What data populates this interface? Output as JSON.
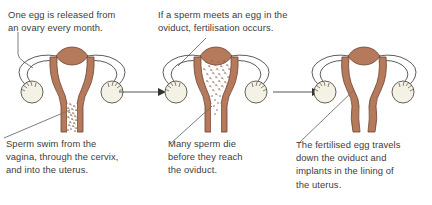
{
  "figure": {
    "background_color": "#ffffff",
    "text_color": "#3c3c3c",
    "organ_color": "#b5795c",
    "organ_outline_color": "#6d4230",
    "ovary_fill_color": "#f4f2e4",
    "ovary_outline_color": "#55504a",
    "outline_color": "#4a4a4a",
    "arrow_color": "#555555",
    "leader_color": "#6f6f6f",
    "sperm_color": "#8a6a55"
  },
  "panels": [
    {
      "id": "panel-1",
      "step_number": "1",
      "caption_top": "One egg is released from\nan ovary every month.",
      "caption_bottom": "Sperm swim from the\nvagina, through the cervix,\nand into the uterus.",
      "diagram_name": "uterus-diagram-egg-release",
      "leader_top_target": "left-ovary",
      "leader_bottom_target": "cervix-and-vagina",
      "sperm_count": 28,
      "sperm_region": "vagina-cervix"
    },
    {
      "id": "panel-2",
      "step_number": "2",
      "caption_top": "If a sperm meets an egg in the\noviduct, fertilisation occurs.",
      "caption_bottom": "Many sperm die\nbefore they reach\nthe oviduct.",
      "diagram_name": "uterus-diagram-sperm-ascent",
      "leader_top_target": "left-oviduct",
      "leader_bottom_target": "uterus-cavity",
      "sperm_count": 70,
      "sperm_region": "uterus-cavity"
    },
    {
      "id": "panel-3",
      "step_number": "3",
      "caption_top": "",
      "caption_bottom": "The fertilised egg travels\ndown the oviduct and\nimplants in the lining of\nthe uterus.",
      "diagram_name": "uterus-diagram-implantation",
      "leader_top_target": "",
      "leader_bottom_target": "uterus-lining",
      "sperm_count": 0,
      "sperm_region": ""
    }
  ],
  "arrows": [
    {
      "id": "arrow-1-to-2",
      "label": "sequence arrow one to two"
    },
    {
      "id": "arrow-2-to-3",
      "label": "sequence arrow two to three"
    }
  ],
  "anatomy_labels": {
    "ovary": "ovary",
    "oviduct": "oviduct",
    "uterus": "uterus",
    "cervix": "cervix",
    "vagina": "vagina"
  }
}
